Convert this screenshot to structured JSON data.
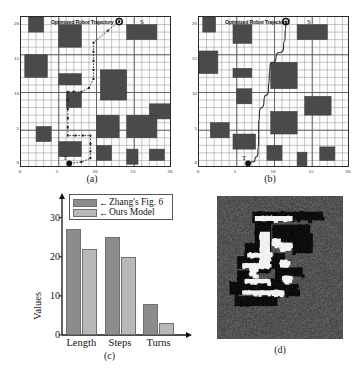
{
  "figure": {
    "panels": [
      {
        "id": "a",
        "caption": "(a)"
      },
      {
        "id": "b",
        "caption": "(b)"
      },
      {
        "id": "c",
        "caption": "(c)"
      },
      {
        "id": "d",
        "caption": "(d)"
      }
    ]
  },
  "map_a": {
    "trajectory_label": "Optimized Robot Trajectory",
    "start_label": "S",
    "target_label": "T",
    "x_ticks": [
      "0",
      "5",
      "10",
      "15",
      "20"
    ],
    "y_ticks": [
      "0",
      "5",
      "10",
      "15",
      "20"
    ],
    "axis_range": [
      0,
      20
    ],
    "start_point": [
      13,
      19.4
    ],
    "target_point": [
      6.4,
      0.6
    ],
    "path_style": "dotted-orthogonal",
    "path_points": [
      [
        13,
        19.4
      ],
      [
        11.5,
        18.2
      ],
      [
        9.6,
        16.6
      ],
      [
        9.6,
        15.4
      ],
      [
        9.6,
        14.2
      ],
      [
        9.6,
        13.0
      ],
      [
        9.6,
        11.8
      ],
      [
        9.0,
        10.6
      ],
      [
        8.0,
        10.1
      ],
      [
        7.0,
        10.1
      ],
      [
        6.2,
        10.1
      ],
      [
        6.2,
        9.0
      ],
      [
        6.2,
        7.8
      ],
      [
        6.2,
        6.6
      ],
      [
        6.2,
        5.4
      ],
      [
        6.2,
        4.3
      ],
      [
        7.2,
        4.3
      ],
      [
        8.2,
        4.3
      ],
      [
        9.2,
        4.3
      ],
      [
        9.2,
        3.2
      ],
      [
        9.2,
        2.2
      ],
      [
        9.2,
        1.3
      ],
      [
        8.0,
        0.8
      ],
      [
        6.4,
        0.6
      ]
    ],
    "obstacles": [
      [
        1.0,
        18.0,
        2.0,
        2.0
      ],
      [
        5.0,
        16.0,
        3.0,
        3.0
      ],
      [
        14.0,
        17.0,
        4.0,
        2.0
      ],
      [
        0.5,
        12.0,
        3.0,
        3.0
      ],
      [
        5.0,
        11.0,
        3.0,
        1.5
      ],
      [
        10.5,
        9.0,
        3.5,
        4.0
      ],
      [
        6.0,
        8.0,
        2.0,
        2.0
      ],
      [
        17.0,
        6.5,
        3.0,
        2.0
      ],
      [
        2.0,
        3.5,
        2.0,
        2.0
      ],
      [
        10.0,
        4.0,
        3.0,
        3.0
      ],
      [
        14.0,
        4.0,
        4.0,
        3.0
      ],
      [
        5.0,
        1.5,
        3.0,
        2.0
      ],
      [
        10.0,
        1.0,
        2.0,
        2.0
      ],
      [
        14.0,
        0.5,
        1.5,
        2.0
      ],
      [
        17.0,
        1.0,
        2.0,
        1.5
      ]
    ]
  },
  "map_b": {
    "trajectory_label": "Optimized Robot Trajectory",
    "start_label": "S",
    "target_label": "T",
    "x_ticks": [
      "0",
      "5",
      "10",
      "15",
      "20"
    ],
    "y_ticks": [
      "0",
      "5",
      "10",
      "15",
      "20"
    ],
    "axis_range": [
      0,
      20
    ],
    "start_point": [
      11.5,
      19.4
    ],
    "target_point": [
      6.5,
      0.6
    ],
    "path_style": "smooth-curve",
    "path_points": [
      [
        11.5,
        19.4
      ],
      [
        11.4,
        17.5
      ],
      [
        11.2,
        16.0
      ],
      [
        10.2,
        14.6
      ],
      [
        9.4,
        13.4
      ],
      [
        9.3,
        12.0
      ],
      [
        9.2,
        10.5
      ],
      [
        8.6,
        8.8
      ],
      [
        8.0,
        7.2
      ],
      [
        7.9,
        5.5
      ],
      [
        7.9,
        3.6
      ],
      [
        7.8,
        2.0
      ],
      [
        7.4,
        1.0
      ],
      [
        6.5,
        0.6
      ]
    ],
    "obstacles": [
      [
        0.5,
        18.0,
        1.7,
        2.0
      ],
      [
        4.5,
        16.5,
        2.5,
        2.5
      ],
      [
        13.0,
        17.0,
        4.0,
        2.0
      ],
      [
        0.0,
        12.5,
        2.5,
        3.0
      ],
      [
        4.5,
        12.0,
        2.5,
        1.2
      ],
      [
        9.5,
        10.5,
        3.5,
        3.5
      ],
      [
        5.0,
        8.5,
        2.0,
        2.0
      ],
      [
        14.0,
        7.0,
        3.5,
        2.5
      ],
      [
        9.5,
        4.5,
        3.5,
        3.0
      ],
      [
        1.5,
        4.0,
        2.5,
        2.0
      ],
      [
        4.5,
        2.5,
        3.0,
        2.0
      ],
      [
        9.0,
        1.0,
        2.0,
        2.0
      ],
      [
        13.0,
        0.3,
        1.3,
        1.8
      ],
      [
        16.0,
        1.0,
        2.0,
        1.8
      ]
    ]
  },
  "chart_data": {
    "type": "bar",
    "title": "",
    "xlabel": "",
    "ylabel": "Values",
    "categories": [
      "Length",
      "Steps",
      "Turns"
    ],
    "ylim": [
      0,
      33
    ],
    "y_ticks": [
      0,
      10,
      20,
      30
    ],
    "y_tick_labels": [
      "0",
      "10",
      "20",
      "30"
    ],
    "grid": false,
    "legend_position": "top-left",
    "series": [
      {
        "name": "Zhang's Fig. 6",
        "color": "#8c8c8c",
        "values": [
          27,
          25,
          8
        ]
      },
      {
        "name": "Ours Model",
        "color": "#b8b8b8",
        "values": [
          22,
          20,
          3
        ]
      }
    ],
    "legend_arrow": "←"
  },
  "occupancy": {
    "background_color": "#525252",
    "obstacle_color": "#0d0d0d",
    "free_color": "#f2f2f2",
    "description": "noisy grayscale occupancy grid map"
  }
}
